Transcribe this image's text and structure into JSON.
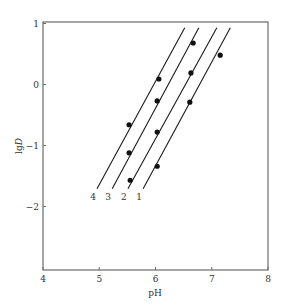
{
  "chart_data": {
    "type": "line",
    "title": "",
    "xlabel": "pH",
    "ylabel_prefix": "lg",
    "ylabel_var": "D",
    "ylabel": "lgD",
    "xlim": [
      4,
      8
    ],
    "ylim": [
      -3,
      1
    ],
    "xticks": [
      4,
      5,
      6,
      7,
      8
    ],
    "yticks": [
      1,
      0,
      -1,
      -2
    ],
    "grid": false,
    "legend": "inline labels at bottom of lines",
    "series": [
      {
        "name": "1",
        "line": [
          [
            5.78,
            -1.71
          ],
          [
            7.33,
            0.93
          ]
        ],
        "points": [
          [
            6.03,
            -1.34
          ],
          [
            6.61,
            -0.29
          ],
          [
            7.15,
            0.48
          ]
        ]
      },
      {
        "name": "2",
        "line": [
          [
            5.51,
            -1.71
          ],
          [
            7.09,
            0.93
          ]
        ],
        "points": [
          [
            5.55,
            -1.57
          ],
          [
            6.03,
            -0.78
          ],
          [
            6.63,
            0.19
          ]
        ]
      },
      {
        "name": "3",
        "line": [
          [
            5.23,
            -1.71
          ],
          [
            6.77,
            0.93
          ]
        ],
        "points": [
          [
            5.53,
            -1.12
          ],
          [
            6.03,
            -0.27
          ],
          [
            6.67,
            0.68
          ]
        ]
      },
      {
        "name": "4",
        "line": [
          [
            4.96,
            -1.71
          ],
          [
            6.52,
            0.93
          ]
        ],
        "points": [
          [
            5.53,
            -0.66
          ],
          [
            6.06,
            0.09
          ]
        ]
      }
    ]
  },
  "layout": {
    "plot": {
      "left": 43,
      "right": 268,
      "top": 22,
      "bottom": 270
    },
    "y_zero_px": 84.5,
    "y_px_per_unit": 61,
    "x_px_per_unit": 56.25
  },
  "colors": {
    "frame": "#6b6b6b",
    "line": "#1a1a1a",
    "point": "#111111",
    "text": "#333333"
  }
}
